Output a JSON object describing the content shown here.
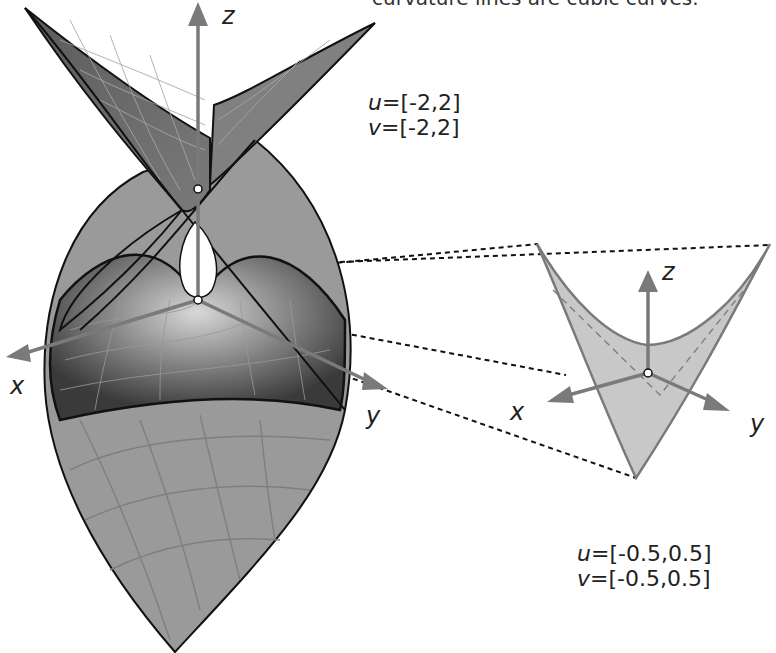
{
  "caption_fragment": "curvature lines are cubic curves.",
  "large_view": {
    "param_u": "=[-2,2]",
    "param_v": "=[-2,2]",
    "u_symbol": "u",
    "v_symbol": "v",
    "axes": {
      "x": "x",
      "y": "y",
      "z": "z"
    }
  },
  "detail_view": {
    "param_u": "=[-0.5,0.5]",
    "param_v": "=[-0.5,0.5]",
    "u_symbol": "u",
    "v_symbol": "v",
    "axes": {
      "x": "x",
      "y": "y",
      "z": "z"
    }
  },
  "colors": {
    "axis": "#7a7a7a",
    "surface_dark": "#4a4a4a",
    "surface_mid": "#8c8c8c",
    "surface_light": "#a8a8a8",
    "detail_fill": "#c8c8c8",
    "outline": "#111111"
  }
}
